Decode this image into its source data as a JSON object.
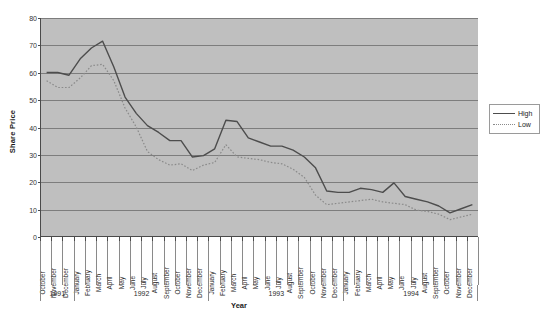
{
  "chart_data": {
    "type": "line",
    "title": "",
    "xlabel": "Year",
    "ylabel": "Share Price",
    "ylim": [
      0,
      80
    ],
    "yticks": [
      0,
      10,
      20,
      30,
      40,
      50,
      60,
      70,
      80
    ],
    "grid": true,
    "legend_position": "right",
    "plot_background": "#bfbfbf",
    "categories": [
      "October",
      "November",
      "December",
      "January",
      "February",
      "March",
      "April",
      "May",
      "June",
      "July",
      "August",
      "September",
      "October",
      "November",
      "December",
      "January",
      "February",
      "March",
      "April",
      "May",
      "June",
      "July",
      "August",
      "September",
      "October",
      "November",
      "December",
      "January",
      "February",
      "March",
      "April",
      "May",
      "June",
      "July",
      "August",
      "September",
      "October",
      "November",
      "December"
    ],
    "year_groups": [
      {
        "label": "1991",
        "count": 3
      },
      {
        "label": "1992",
        "count": 12
      },
      {
        "label": "1993",
        "count": 12
      },
      {
        "label": "1994",
        "count": 12
      }
    ],
    "series": [
      {
        "name": "High",
        "color": "#4d4d4d",
        "style": "solid",
        "values": [
          60,
          60,
          59,
          65,
          69,
          71.5,
          62,
          51,
          45,
          40.5,
          38,
          35,
          35,
          29,
          29.5,
          32,
          42.5,
          42,
          36,
          34.5,
          33,
          33,
          31.5,
          29,
          25,
          16.5,
          16,
          16,
          17.5,
          17,
          16,
          19.5,
          14.5,
          13.5,
          12.5,
          11,
          8.5,
          10,
          11.5
        ]
      },
      {
        "name": "Low",
        "color": "#8a8a8a",
        "style": "dotted",
        "values": [
          57,
          54.5,
          54.5,
          58,
          62.5,
          63,
          57,
          47,
          40,
          31,
          28,
          26,
          26.5,
          24,
          26,
          27,
          33.5,
          29,
          28.5,
          28,
          27,
          26.5,
          24.5,
          21.5,
          15,
          11.5,
          12,
          12.5,
          13,
          13.5,
          12.5,
          12,
          11.5,
          9.5,
          9,
          8,
          6,
          7,
          8
        ]
      }
    ]
  },
  "legend": {
    "items": [
      {
        "label": "High"
      },
      {
        "label": "Low"
      }
    ]
  }
}
